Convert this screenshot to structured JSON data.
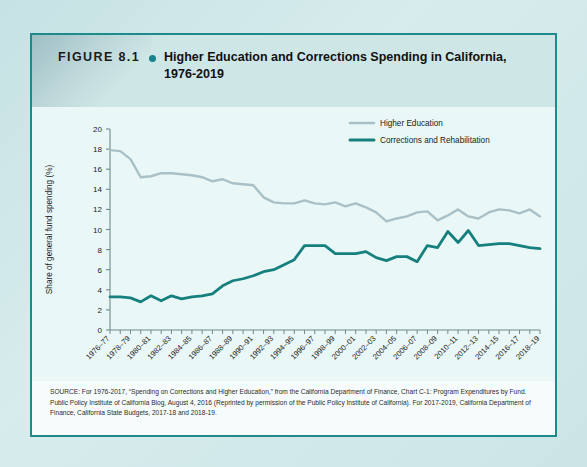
{
  "figure": {
    "label": "FIGURE 8.1",
    "bullet": "bullet-dot",
    "title": "Higher Education and Corrections Spending in California, 1976-2019"
  },
  "source": {
    "text": "SOURCE: For 1976-2017, “Spending on Corrections and Higher Education,” from the California Department of Finance, Chart C-1: Program Expenditures by Fund. Public Policy Institute of California Blog, August 4, 2016 (Reprinted by permission of the Public Policy Institute of California). For 2017-2019, California Department of Finance, California State Budgets, 2017-18 and 2018-19."
  },
  "colors": {
    "higher_education": "#a9c1c6",
    "corrections": "#16807f",
    "card_border": "#1e8a8c",
    "header_band": "#cfe6e6",
    "plot_background": "#eaf7f7",
    "page_background": "#cde6e7",
    "axis": "#6f8a8c",
    "text": "#1b1b1b"
  },
  "chart_data": {
    "type": "line",
    "title": "Higher Education and Corrections Spending in California, 1976-2019",
    "xlabel": "",
    "ylabel": "Share of general fund spending (%)",
    "ylim": [
      0,
      20
    ],
    "yticks": [
      0,
      2,
      4,
      6,
      8,
      10,
      12,
      14,
      16,
      18,
      20
    ],
    "grid": false,
    "legend_position": "top-right",
    "x": [
      "1976-77",
      "1977-78",
      "1978-79",
      "1979-80",
      "1980-81",
      "1981-82",
      "1982-83",
      "1983-84",
      "1984-85",
      "1985-86",
      "1986-87",
      "1987-88",
      "1988-89",
      "1989-90",
      "1990-91",
      "1991-92",
      "1992-93",
      "1993-94",
      "1994-95",
      "1995-96",
      "1996-97",
      "1997-98",
      "1998-99",
      "1999-00",
      "2000-01",
      "2001-02",
      "2002-03",
      "2003-04",
      "2004-05",
      "2005-06",
      "2006-07",
      "2007-08",
      "2008-09",
      "2009-10",
      "2010-11",
      "2011-12",
      "2012-13",
      "2013-14",
      "2014-15",
      "2015-16",
      "2016-17",
      "2017-18",
      "2018-19"
    ],
    "xticklabels": [
      "1976–77",
      "1978–79",
      "1980–81",
      "1982–83",
      "1984–85",
      "1986–87",
      "1988–89",
      "1990–91",
      "1992–93",
      "1994–95",
      "1996–97",
      "1998–99",
      "2000–01",
      "2002–03",
      "2004–05",
      "2006–07",
      "2008–09",
      "2010–11",
      "2012–13",
      "2014–15",
      "2016–17",
      "2018–19"
    ],
    "xticklabel_step": 2,
    "series": [
      {
        "name": "Higher Education",
        "color": "#a9c1c6",
        "values": [
          17.9,
          17.8,
          17.0,
          15.2,
          15.3,
          15.6,
          15.6,
          15.5,
          15.4,
          15.2,
          14.8,
          15.0,
          14.6,
          14.5,
          14.4,
          13.2,
          12.7,
          12.6,
          12.6,
          12.9,
          12.6,
          12.5,
          12.7,
          12.3,
          12.6,
          12.2,
          11.7,
          10.8,
          11.1,
          11.3,
          11.7,
          11.8,
          10.9,
          11.4,
          12.0,
          11.3,
          11.1,
          11.7,
          12.0,
          11.9,
          11.6,
          12.0,
          11.3
        ]
      },
      {
        "name": "Corrections and Rehabilitation",
        "color": "#16807f",
        "values": [
          3.3,
          3.3,
          3.2,
          2.8,
          3.4,
          2.9,
          3.4,
          3.1,
          3.3,
          3.4,
          3.6,
          4.4,
          4.9,
          5.1,
          5.4,
          5.8,
          6.0,
          6.5,
          7.0,
          8.4,
          8.4,
          8.4,
          7.6,
          7.6,
          7.6,
          7.8,
          7.2,
          6.9,
          7.3,
          7.3,
          6.8,
          8.4,
          8.2,
          9.8,
          8.7,
          9.9,
          8.4,
          8.5,
          8.6,
          8.6,
          8.4,
          8.2,
          8.1
        ]
      }
    ],
    "legend": [
      {
        "label": "Higher Education",
        "color": "#a9c1c6"
      },
      {
        "label": "Corrections and Rehabilitation",
        "color": "#16807f"
      }
    ]
  }
}
